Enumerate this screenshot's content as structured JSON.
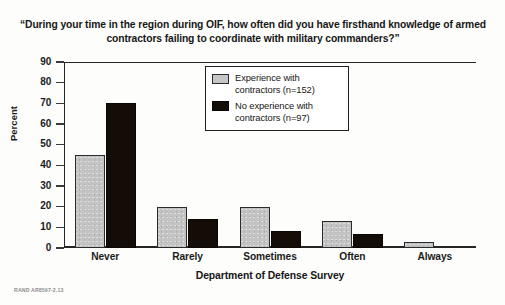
{
  "figure": {
    "source_credit": "RAND AR8597-2.13"
  },
  "chart_data": {
    "type": "bar",
    "title": "“During your time in the region during OIF, how often did you have firsthand knowledge of armed contractors failing to coordinate with military commanders?”",
    "xlabel": "Department of Defense Survey",
    "ylabel": "Percent",
    "ylim": [
      0,
      90
    ],
    "yticks": [
      0,
      10,
      20,
      30,
      40,
      50,
      60,
      70,
      80,
      90
    ],
    "grid": false,
    "legend_position": "upper center",
    "categories": [
      "Never",
      "Rarely",
      "Sometimes",
      "Often",
      "Always"
    ],
    "series": [
      {
        "name": "Experience with contractors (n=152)",
        "color": "#c3c3c3",
        "values": [
          45,
          20,
          20,
          13,
          3
        ]
      },
      {
        "name": "No experience with contractors (n=97)",
        "color": "#140d07",
        "values": [
          70,
          14,
          8,
          7,
          0
        ]
      }
    ]
  },
  "legend": {
    "items": [
      {
        "label_line1": "Experience with",
        "label_line2": "contractors (n=152)",
        "swatch": "gray"
      },
      {
        "label_line1": "No experience with",
        "label_line2": "contractors (n=97)",
        "swatch": "black"
      }
    ]
  }
}
